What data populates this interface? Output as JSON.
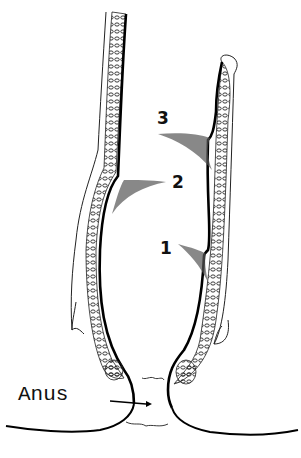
{
  "diagram": {
    "type": "anatomical-line-drawing",
    "labels": [
      {
        "id": "fold-1",
        "text": "1"
      },
      {
        "id": "fold-2",
        "text": "2"
      },
      {
        "id": "fold-3",
        "text": "3"
      },
      {
        "id": "anus",
        "text": "Anus"
      }
    ],
    "colors": {
      "ink": "#111111",
      "background": "#ffffff"
    }
  }
}
